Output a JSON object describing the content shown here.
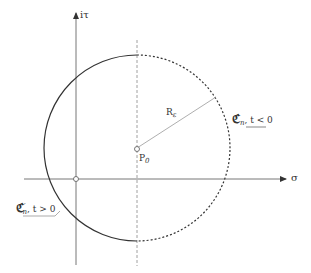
{
  "axes": {
    "vertical_label": "iτ",
    "horizontal_label": "σ"
  },
  "center": {
    "label": "P",
    "subscript": "0"
  },
  "radius": {
    "label": "R",
    "subscript": "ε"
  },
  "contour_right": {
    "symbol": "ℭ",
    "subscript": "n",
    "condition": ", t < 0",
    "style": "dashed"
  },
  "contour_left": {
    "symbol": "ℭ",
    "subscript": "n",
    "prime": "′",
    "condition": ", t > 0",
    "style": "solid"
  },
  "colors": {
    "stroke": "#333333",
    "light_stroke": "#888888"
  }
}
